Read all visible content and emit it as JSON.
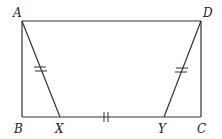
{
  "diagram": {
    "type": "geometry-figure",
    "points": {
      "A": {
        "label": "A",
        "x": 22,
        "y": 21
      },
      "D": {
        "label": "D",
        "x": 201,
        "y": 21
      },
      "B": {
        "label": "B",
        "x": 22,
        "y": 117
      },
      "C": {
        "label": "C",
        "x": 201,
        "y": 117
      },
      "X": {
        "label": "X",
        "x": 60,
        "y": 117
      },
      "Y": {
        "label": "Y",
        "x": 164,
        "y": 117
      }
    },
    "segments": [
      "AD",
      "AB",
      "DC",
      "BC",
      "AX",
      "DY"
    ],
    "congruence_marks": [
      {
        "segment": "AX",
        "ticks": 2
      },
      {
        "segment": "XY",
        "ticks": 2
      },
      {
        "segment": "DY",
        "ticks": 2
      }
    ],
    "colors": {
      "stroke": "#333333",
      "background": "#ffffff"
    }
  }
}
